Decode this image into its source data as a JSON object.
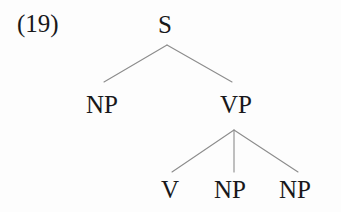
{
  "figure": {
    "example_number": "(19)",
    "kind": "syntax-tree",
    "background_color": "#fdfdfd",
    "text_color": "#18181a",
    "edge_color": "#8c8c8c"
  },
  "tree": {
    "nodes": [
      {
        "id": "s",
        "label": "S",
        "x": 167,
        "y": 24,
        "level": 0
      },
      {
        "id": "np_subject",
        "label": "NP",
        "x": 104,
        "y": 104,
        "level": 1
      },
      {
        "id": "vp",
        "label": "VP",
        "x": 236,
        "y": 104,
        "level": 1
      },
      {
        "id": "v",
        "label": "V",
        "x": 171,
        "y": 189,
        "level": 2
      },
      {
        "id": "np_obj1",
        "label": "NP",
        "x": 233,
        "y": 189,
        "level": 2
      },
      {
        "id": "np_obj2",
        "label": "NP",
        "x": 298,
        "y": 189,
        "level": 2
      }
    ],
    "edges": [
      {
        "from": "s",
        "to": "np_subject",
        "x1": 167,
        "y1": 45,
        "x2": 104,
        "y2": 82
      },
      {
        "from": "s",
        "to": "vp",
        "x1": 167,
        "y1": 45,
        "x2": 232,
        "y2": 82
      },
      {
        "from": "vp",
        "to": "v",
        "x1": 234,
        "y1": 130,
        "x2": 172,
        "y2": 172
      },
      {
        "from": "vp",
        "to": "np_obj1",
        "x1": 234,
        "y1": 130,
        "x2": 234,
        "y2": 172
      },
      {
        "from": "vp",
        "to": "np_obj2",
        "x1": 234,
        "y1": 130,
        "x2": 298,
        "y2": 172
      }
    ]
  }
}
